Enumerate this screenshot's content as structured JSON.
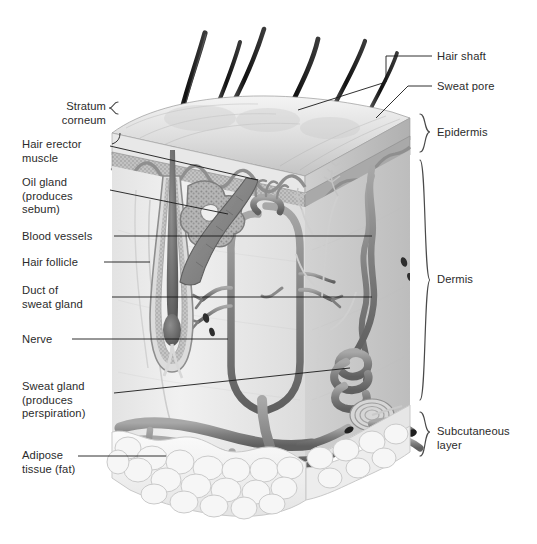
{
  "diagram": {
    "palette": {
      "background": "#ffffff",
      "text": "#2b2b2b",
      "leader_line": "#1a1a1a",
      "bracket": "#4a4a4a",
      "hair_dark": "#1b1b1b",
      "epidermis_surface": "#dcdcdc",
      "stratum_granular": "#b4b4b4",
      "dermis_fill": "#ececec",
      "vessel_gray": "#8c8c8c",
      "vessel_dark": "#6e6e6e",
      "fat_fill": "#f2f2f2",
      "fat_edge": "#c9c9c9"
    },
    "labels_left": [
      {
        "id": "stratum-corneum",
        "text": "Stratum\ncorneum",
        "x": 22,
        "y": 100,
        "width": 84,
        "align": "right"
      },
      {
        "id": "hair-erector-muscle",
        "text": "Hair erector\nmuscle",
        "x": 22,
        "y": 138,
        "width": 84,
        "align": "left"
      },
      {
        "id": "oil-gland",
        "text": "Oil gland\n(produces\nsebum)",
        "x": 22,
        "y": 176,
        "width": 84,
        "align": "left"
      },
      {
        "id": "blood-vessels",
        "text": "Blood vessels",
        "x": 22,
        "y": 230,
        "width": 90,
        "align": "left"
      },
      {
        "id": "hair-follicle",
        "text": "Hair follicle",
        "x": 22,
        "y": 258,
        "width": 90,
        "align": "left"
      },
      {
        "id": "duct-of-sweat-gland",
        "text": "Duct of\nsweat gland",
        "x": 22,
        "y": 285,
        "width": 90,
        "align": "left"
      },
      {
        "id": "nerve",
        "text": "Nerve",
        "x": 22,
        "y": 333,
        "width": 48,
        "align": "left"
      },
      {
        "id": "sweat-gland",
        "text": "Sweat gland\n(produces\nperspiration)",
        "x": 22,
        "y": 381,
        "width": 90,
        "align": "left"
      },
      {
        "id": "adipose-tissue",
        "text": "Adipose\ntissue (fat)",
        "x": 22,
        "y": 450,
        "width": 84,
        "align": "left"
      }
    ],
    "labels_right": [
      {
        "id": "hair-shaft",
        "text": "Hair shaft",
        "x": 437,
        "y": 51,
        "align": "left"
      },
      {
        "id": "sweat-pore",
        "text": "Sweat pore",
        "x": 437,
        "y": 81,
        "align": "left"
      },
      {
        "id": "epidermis",
        "text": "Epidermis",
        "x": 437,
        "y": 139,
        "align": "left"
      },
      {
        "id": "dermis",
        "text": "Dermis",
        "x": 437,
        "y": 287,
        "align": "left"
      },
      {
        "id": "subcutaneous-layer",
        "text": "Subcutaneous\nlayer",
        "x": 437,
        "y": 432,
        "align": "left"
      }
    ],
    "structures": [
      {
        "id": "hair-shafts",
        "count": 6,
        "note": "dark tapering hairs emerging from surface"
      },
      {
        "id": "epidermis-band",
        "note": "layered surface band with stratum corneum on top"
      },
      {
        "id": "dermis-body",
        "note": "pale fibrous region containing follicle, glands, vessels, nerves"
      },
      {
        "id": "hair-follicle-bulb",
        "note": "deep bulb at base of follicle"
      },
      {
        "id": "sebaceous-oil-gland",
        "note": "lobed gland attached to follicle"
      },
      {
        "id": "arrector-pili-muscle",
        "note": "diagonal muscle band from follicle to epidermis"
      },
      {
        "id": "sweat-gland-coil",
        "note": "coiled tubular gland in deep dermis"
      },
      {
        "id": "sweat-duct",
        "note": "spiral duct rising to surface pore"
      },
      {
        "id": "blood-vessel-network",
        "note": "branching capillary loops around follicle"
      },
      {
        "id": "nerve-fibers",
        "note": "fine branching fibers with receptor endings"
      },
      {
        "id": "pacinian-corpuscle",
        "note": "concentric oval pressure receptor"
      },
      {
        "id": "subcutaneous-fat",
        "note": "cluster of rounded adipocyte lobules at base"
      },
      {
        "id": "deep-vessels",
        "note": "large cut arteries and veins at fat layer"
      }
    ]
  }
}
